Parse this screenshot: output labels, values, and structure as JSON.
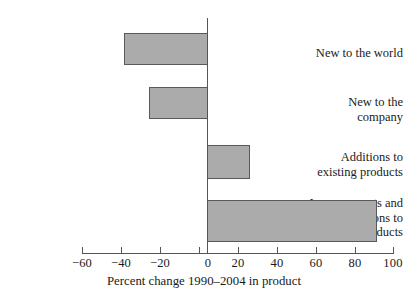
{
  "chart_data": {
    "type": "bar",
    "orientation": "horizontal",
    "title": "",
    "xlabel": "Percent change 1990–2004 in product",
    "ylabel": "",
    "categories": [
      "New to the world",
      "New to the\ncompany",
      "Additions to\nexisting products",
      "Improvements and\nmodifications to\nexisting products"
    ],
    "values": [
      -40,
      -28,
      20,
      80
    ],
    "xlim": [
      -60,
      100
    ],
    "xticks": [
      -60,
      -40,
      -20,
      0,
      20,
      40,
      60,
      80,
      100
    ],
    "xtick_labels": [
      "−60",
      "−40",
      "−20",
      "0",
      "20",
      "40",
      "60",
      "80",
      "100"
    ],
    "grid": false,
    "legend": null,
    "bar_fill_color": "#ababab",
    "bar_edge_color": "#595959",
    "axis_color": "#555555",
    "background_color": "#ffffff"
  },
  "categories_display": [
    "New to the world",
    "New to the<br>company",
    "Additions to<br>existing products",
    "Improvements and<br>modifications to<br>existing products"
  ]
}
